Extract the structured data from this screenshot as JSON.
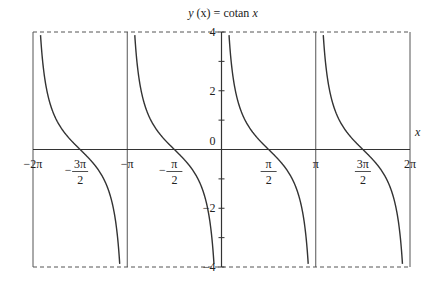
{
  "chart_data": {
    "type": "line",
    "title": "y (x) = cotan x",
    "title_parts": {
      "y": "y",
      "x_paren": "(x)",
      "eq": " = cotan ",
      "x": "x"
    },
    "xlabel": "x",
    "ylabel": "",
    "xlim": [
      -6.2832,
      6.2832
    ],
    "ylim": [
      -4,
      4
    ],
    "grid": false,
    "x_ticks": [
      {
        "value": -6.2832,
        "label": "-2π"
      },
      {
        "value": -4.7124,
        "label": "-3π/2"
      },
      {
        "value": -3.1416,
        "label": "-π"
      },
      {
        "value": -1.5708,
        "label": "-π/2"
      },
      {
        "value": 1.5708,
        "label": "π/2"
      },
      {
        "value": 3.1416,
        "label": "π"
      },
      {
        "value": 4.7124,
        "label": "3π/2"
      },
      {
        "value": 6.2832,
        "label": "2π"
      }
    ],
    "y_ticks": [
      {
        "value": 4,
        "label": "4"
      },
      {
        "value": 3,
        "label": ""
      },
      {
        "value": 2,
        "label": "2"
      },
      {
        "value": 1,
        "label": ""
      },
      {
        "value": 0,
        "label": "0"
      },
      {
        "value": -1,
        "label": ""
      },
      {
        "value": -2,
        "label": "-2"
      },
      {
        "value": -3,
        "label": ""
      },
      {
        "value": -4,
        "label": "-4"
      }
    ],
    "asymptotes": [
      -6.2832,
      -3.1416,
      0,
      3.1416,
      6.2832
    ],
    "series": [
      {
        "name": "cotan x",
        "function": "cot",
        "branches": [
          [
            -6.2832,
            -3.1416
          ],
          [
            -3.1416,
            0
          ],
          [
            0,
            3.1416
          ],
          [
            3.1416,
            6.2832
          ]
        ]
      }
    ],
    "zeros": [
      -4.7124,
      -1.5708,
      1.5708,
      4.7124
    ],
    "colors": {
      "curve": "#333333",
      "axis": "#333333",
      "frame": "#555555"
    }
  }
}
